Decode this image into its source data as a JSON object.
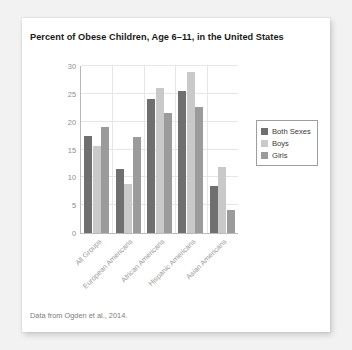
{
  "chart_data": {
    "type": "bar",
    "title": "Percent of Obese Children, Age 6–11, in the United States",
    "xlabel": "",
    "ylabel": "",
    "ylim": [
      0,
      30
    ],
    "yticks": [
      0,
      5,
      10,
      15,
      20,
      25,
      30
    ],
    "grid": "horizontal-and-group-separators",
    "legend_position": "right",
    "categories": [
      "All Groups",
      "European Americans",
      "African Americans",
      "Hispanic Americans",
      "Asian Americans"
    ],
    "series": [
      {
        "name": "Both Sexes",
        "color": "#6f6f6f",
        "values": [
          17.5,
          11.5,
          24.1,
          25.6,
          8.4
        ]
      },
      {
        "name": "Boys",
        "color": "#c9c9c9",
        "values": [
          15.6,
          8.8,
          26.0,
          29.0,
          11.9
        ]
      },
      {
        "name": "Girls",
        "color": "#9b9b9b",
        "values": [
          19.0,
          17.2,
          21.5,
          22.6,
          4.2
        ]
      }
    ],
    "footnote": "Data from Ogden et al., 2014."
  },
  "legend": {
    "items": [
      {
        "label": "Both Sexes"
      },
      {
        "label": "Boys"
      },
      {
        "label": "Girls"
      }
    ]
  },
  "colors": {
    "both_sexes": "#6f6f6f",
    "boys": "#c9c9c9",
    "girls": "#9b9b9b",
    "axis": "#b9b9b9",
    "grid": "#e6e6e6",
    "page_background": "#f2f2f2",
    "card_background": "#ffffff"
  }
}
